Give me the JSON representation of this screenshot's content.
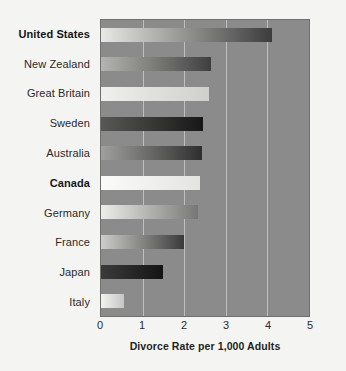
{
  "chart_data": {
    "type": "bar",
    "orientation": "horizontal",
    "title": "",
    "xlabel": "Divorce Rate per 1,000 Adults",
    "ylabel": "",
    "xlim": [
      0,
      5
    ],
    "xticks": [
      0,
      1,
      2,
      3,
      4,
      5
    ],
    "xticklabels": [
      "0",
      "1",
      "2",
      "3",
      "4",
      "5"
    ],
    "grid": "vertical",
    "legend": "none",
    "categories": [
      "United States",
      "New Zealand",
      "Great Britain",
      "Sweden",
      "Australia",
      "Canada",
      "Germany",
      "France",
      "Japan",
      "Italy"
    ],
    "values": [
      4.1,
      2.65,
      2.6,
      2.45,
      2.42,
      2.38,
      2.32,
      2.0,
      1.5,
      0.55
    ],
    "emphasized_categories": [
      "United States",
      "Canada"
    ],
    "bars": [
      {
        "label": "United States",
        "value": 4.1,
        "bold": true,
        "fill_start": "#e8e8e6",
        "fill_end": "#3c3c3c"
      },
      {
        "label": "New Zealand",
        "value": 2.65,
        "bold": false,
        "fill_start": "#b4b4b2",
        "fill_end": "#3f3f3f"
      },
      {
        "label": "Great Britain",
        "value": 2.6,
        "bold": false,
        "fill_start": "#f0f0ee",
        "fill_end": "#cfcfcd"
      },
      {
        "label": "Sweden",
        "value": 2.45,
        "bold": false,
        "fill_start": "#585856",
        "fill_end": "#171717"
      },
      {
        "label": "Australia",
        "value": 2.42,
        "bold": false,
        "fill_start": "#a0a09e",
        "fill_end": "#2e2e2e"
      },
      {
        "label": "Canada",
        "value": 2.38,
        "bold": true,
        "fill_start": "#fbfbf9",
        "fill_end": "#e4e4e2"
      },
      {
        "label": "Germany",
        "value": 2.32,
        "bold": false,
        "fill_start": "#ededeb",
        "fill_end": "#777775"
      },
      {
        "label": "France",
        "value": 2.0,
        "bold": false,
        "fill_start": "#cdcdcb",
        "fill_end": "#3a3a3a"
      },
      {
        "label": "Japan",
        "value": 1.5,
        "bold": false,
        "fill_start": "#3b3b3b",
        "fill_end": "#141414"
      },
      {
        "label": "Italy",
        "value": 0.55,
        "bold": false,
        "fill_start": "#f2f2f0",
        "fill_end": "#c6c6c4"
      }
    ],
    "colors": {
      "figure_background": "#f4f4f2",
      "plot_background": "#8b8b8b",
      "gridline": "#c8c8c6",
      "axis_border": "#6f6f6f",
      "text": "#2a2a2a"
    }
  }
}
